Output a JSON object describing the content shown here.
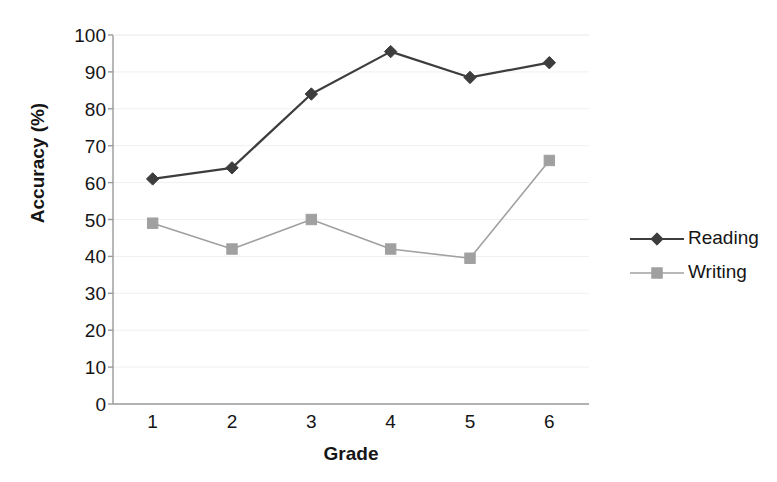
{
  "chart_data": {
    "type": "line",
    "title": "",
    "xlabel": "Grade",
    "ylabel": "Accuracy (%)",
    "categories": [
      "1",
      "2",
      "3",
      "4",
      "5",
      "6"
    ],
    "xtick_labels": [
      "1",
      "2",
      "3",
      "4",
      "5",
      "6"
    ],
    "ytick_labels": [
      "0",
      "10",
      "20",
      "30",
      "40",
      "50",
      "60",
      "70",
      "80",
      "90",
      "100"
    ],
    "ylim": [
      0,
      100
    ],
    "ytick_step": 10,
    "grid": "horizontal-faint",
    "legend_position": "right",
    "series": [
      {
        "name": "Reading",
        "marker": "diamond",
        "color": "#3d3d3d",
        "values": [
          61,
          64,
          84,
          95.5,
          88.5,
          92.5
        ]
      },
      {
        "name": "Writing",
        "marker": "square",
        "color": "#a0a0a0",
        "values": [
          49,
          42,
          50,
          42,
          39.5,
          66
        ]
      }
    ]
  },
  "legend": {
    "items": [
      {
        "label": "Reading"
      },
      {
        "label": "Writing"
      }
    ]
  },
  "colors": {
    "reading": "#3d3d3d",
    "writing": "#a0a0a0",
    "axis": "#999999",
    "grid": "#f0f0f0",
    "text": "#151515",
    "background": "#ffffff"
  }
}
